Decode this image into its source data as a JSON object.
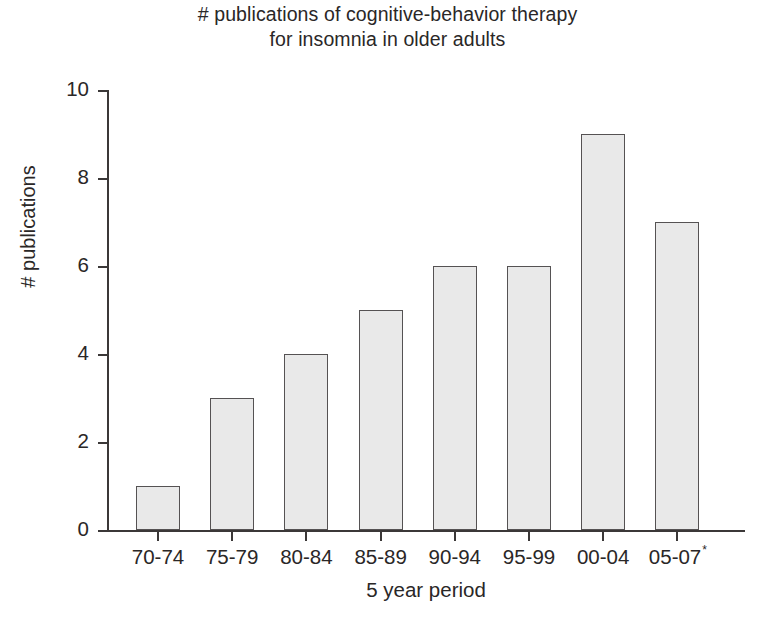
{
  "chart_data": {
    "type": "bar",
    "title": "# publications of cognitive-behavior therapy for insomnia in older adults",
    "title_lines": [
      "# publications of cognitive-behavior therapy",
      "for insomnia in older adults"
    ],
    "xlabel": "5 year period",
    "ylabel": "# publications",
    "categories": [
      "70-74",
      "75-79",
      "80-84",
      "85-89",
      "90-94",
      "95-99",
      "00-04",
      "05-07"
    ],
    "category_marks": [
      "",
      "",
      "",
      "",
      "",
      "",
      "",
      "*"
    ],
    "values": [
      1,
      3,
      4,
      5,
      6,
      6,
      9,
      7
    ],
    "ylim": [
      0,
      10
    ],
    "ytick_labels": [
      "0",
      "2",
      "4",
      "6",
      "8",
      "10"
    ],
    "ytick_values": [
      0,
      2,
      4,
      6,
      8,
      10
    ],
    "grid": false,
    "legend": "none",
    "bar_fill_color": "#e9e9e9",
    "bar_edge_color": "#555253",
    "axis_color": "#3b3838",
    "text_color": "#2a2727",
    "background_color": "#ffffff"
  }
}
